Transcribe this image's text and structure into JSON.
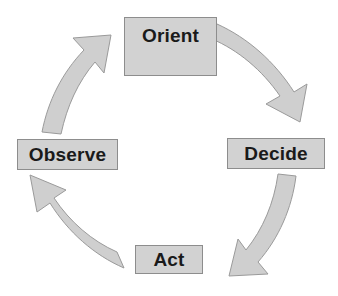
{
  "diagram": {
    "type": "cycle",
    "direction": "clockwise",
    "colors": {
      "box_fill": "#d2d2d2",
      "box_border": "#8d8d8d",
      "arrow_fill": "#cfcfcf",
      "arrow_border": "#9a9a9a",
      "text": "#1a1a1a",
      "background": "#ffffff"
    },
    "nodes": [
      {
        "id": "orient",
        "label": "Orient",
        "position": "top"
      },
      {
        "id": "decide",
        "label": "Decide",
        "position": "right"
      },
      {
        "id": "act",
        "label": "Act",
        "position": "bottom"
      },
      {
        "id": "observe",
        "label": "Observe",
        "position": "left"
      }
    ],
    "arrows": [
      {
        "id": "orient-to-decide",
        "from": "Orient",
        "to": "Decide",
        "name": "arrow-orient-to-decide"
      },
      {
        "id": "decide-to-act",
        "from": "Decide",
        "to": "Act",
        "name": "arrow-decide-to-act"
      },
      {
        "id": "act-to-observe",
        "from": "Act",
        "to": "Observe",
        "name": "arrow-act-to-observe"
      },
      {
        "id": "observe-to-orient",
        "from": "Observe",
        "to": "Orient",
        "name": "arrow-observe-to-orient"
      }
    ]
  }
}
